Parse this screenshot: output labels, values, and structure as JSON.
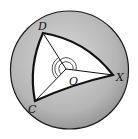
{
  "diagram": {
    "type": "spherical-triangle-on-sphere",
    "sphere": {
      "center": [
        69.5,
        70
      ],
      "radius": 59,
      "fill": "#b8b8b8",
      "edge_color": "#1a1a1a"
    },
    "triangle": {
      "fill": "#ffffff",
      "stroke": "#111111",
      "vertices": {
        "D": [
          43,
          33
        ],
        "X": [
          113,
          75
        ],
        "C": [
          35,
          101
        ]
      }
    },
    "center_point": {
      "label": "O",
      "pos": [
        66,
        69
      ]
    },
    "labels": {
      "D": "D",
      "X": "X",
      "C": "C",
      "O": "O"
    },
    "angle_marks": {
      "count": 3,
      "at": "O"
    }
  }
}
